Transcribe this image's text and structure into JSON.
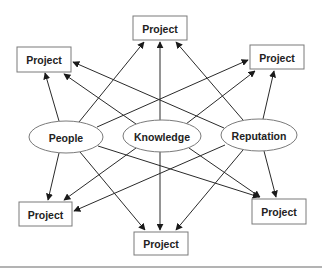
{
  "diagram": {
    "sources": [
      {
        "id": "people",
        "label": "People",
        "cx": 66,
        "cy": 137,
        "rx": 37,
        "ry": 16
      },
      {
        "id": "knowledge",
        "label": "Knowledge",
        "cx": 162,
        "cy": 136,
        "rx": 39,
        "ry": 16
      },
      {
        "id": "reputation",
        "label": "Reputation",
        "cx": 259,
        "cy": 135,
        "rx": 38,
        "ry": 16
      }
    ],
    "targets": [
      {
        "id": "top",
        "label": "Project",
        "x": 133,
        "y": 16,
        "w": 54,
        "h": 24
      },
      {
        "id": "upper-left",
        "label": "Project",
        "x": 17,
        "y": 47,
        "w": 54,
        "h": 25
      },
      {
        "id": "upper-right",
        "label": "Project",
        "x": 250,
        "y": 45,
        "w": 54,
        "h": 24
      },
      {
        "id": "lower-left",
        "label": "Project",
        "x": 19,
        "y": 202,
        "w": 53,
        "h": 24
      },
      {
        "id": "lower-right",
        "label": "Project",
        "x": 252,
        "y": 199,
        "w": 54,
        "h": 25
      },
      {
        "id": "bottom",
        "label": "Project",
        "x": 134,
        "y": 232,
        "w": 54,
        "h": 23
      }
    ],
    "edges": [
      {
        "from": "people",
        "to": "upper-left",
        "x1": 59,
        "y1": 121,
        "x2": 45,
        "y2": 73
      },
      {
        "from": "people",
        "to": "top",
        "x1": 79,
        "y1": 122,
        "x2": 144,
        "y2": 42
      },
      {
        "from": "people",
        "to": "upper-right",
        "x1": 97,
        "y1": 127,
        "x2": 248,
        "y2": 60
      },
      {
        "from": "knowledge",
        "to": "upper-left",
        "x1": 136,
        "y1": 124,
        "x2": 64,
        "y2": 74
      },
      {
        "from": "knowledge",
        "to": "top",
        "x1": 160,
        "y1": 120,
        "x2": 160,
        "y2": 42
      },
      {
        "from": "knowledge",
        "to": "upper-right",
        "x1": 186,
        "y1": 124,
        "x2": 255,
        "y2": 71
      },
      {
        "from": "reputation",
        "to": "upper-left",
        "x1": 224,
        "y1": 128,
        "x2": 73,
        "y2": 62
      },
      {
        "from": "reputation",
        "to": "top",
        "x1": 243,
        "y1": 120,
        "x2": 176,
        "y2": 42
      },
      {
        "from": "reputation",
        "to": "upper-right",
        "x1": 263,
        "y1": 119,
        "x2": 274,
        "y2": 71
      },
      {
        "from": "people",
        "to": "lower-left",
        "x1": 59,
        "y1": 153,
        "x2": 48,
        "y2": 200
      },
      {
        "from": "people",
        "to": "bottom",
        "x1": 80,
        "y1": 152,
        "x2": 145,
        "y2": 230
      },
      {
        "from": "people",
        "to": "lower-right",
        "x1": 98,
        "y1": 146,
        "x2": 259,
        "y2": 197
      },
      {
        "from": "knowledge",
        "to": "lower-left",
        "x1": 136,
        "y1": 148,
        "x2": 64,
        "y2": 200
      },
      {
        "from": "knowledge",
        "to": "bottom",
        "x1": 160,
        "y1": 152,
        "x2": 160,
        "y2": 230
      },
      {
        "from": "knowledge",
        "to": "lower-right",
        "x1": 189,
        "y1": 148,
        "x2": 260,
        "y2": 197
      },
      {
        "from": "reputation",
        "to": "lower-left",
        "x1": 225,
        "y1": 145,
        "x2": 74,
        "y2": 211
      },
      {
        "from": "reputation",
        "to": "bottom",
        "x1": 243,
        "y1": 150,
        "x2": 176,
        "y2": 230
      },
      {
        "from": "reputation",
        "to": "lower-right",
        "x1": 264,
        "y1": 151,
        "x2": 276,
        "y2": 197
      }
    ],
    "rule": {
      "x1": 0,
      "y1": 267,
      "x2": 322,
      "y2": 267
    }
  }
}
